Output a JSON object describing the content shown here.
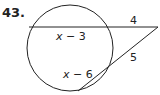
{
  "problem": {
    "number": "43.",
    "segments": {
      "chord_internal": {
        "var": "x",
        "rest": " − 3"
      },
      "chord_external": "4",
      "secant_external": "5",
      "secant_internal": {
        "var": "x",
        "rest": " − 6"
      }
    }
  },
  "colors": {
    "stroke": "#222222",
    "background": "#ffffff"
  }
}
